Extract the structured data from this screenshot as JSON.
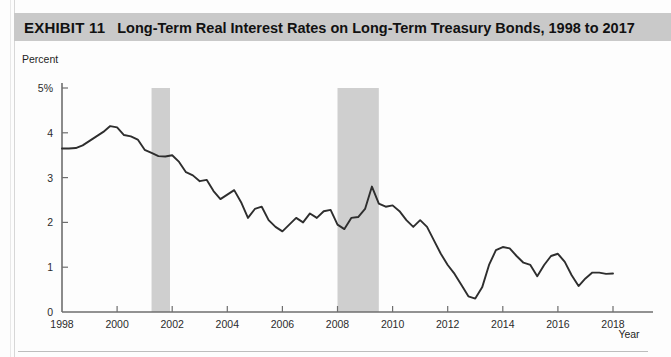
{
  "exhibit": {
    "label": "EXHIBIT 11",
    "title": "Long-Term Real Interest Rates on Long-Term Treasury Bonds, 1998 to 2017"
  },
  "axis": {
    "y_label": "Percent",
    "x_label": "Year"
  },
  "chart_data": {
    "type": "line",
    "title": "Long-Term Real Interest Rates on Long-Term Treasury Bonds, 1998 to 2017",
    "xlabel": "Year",
    "ylabel": "Percent",
    "xlim": [
      1998,
      2018
    ],
    "ylim": [
      0,
      5
    ],
    "xticks": [
      1998,
      2000,
      2002,
      2004,
      2006,
      2008,
      2010,
      2012,
      2014,
      2016,
      2018
    ],
    "xtick_labels": [
      "1998",
      "2000",
      "2002",
      "2004",
      "2006",
      "2008",
      "2010",
      "2012",
      "2014",
      "2016",
      "2018"
    ],
    "yticks": [
      0,
      1,
      2,
      3,
      4,
      5
    ],
    "ytick_labels": [
      "0",
      "1",
      "2",
      "3",
      "4",
      "5%"
    ],
    "grid": false,
    "legend": null,
    "line_color": "#2e2e2e",
    "shaded_regions": [
      {
        "name": "recession-2001",
        "x0": 2001.25,
        "x1": 2001.92,
        "color": "#cfcfcf"
      },
      {
        "name": "recession-2008",
        "x0": 2008.0,
        "x1": 2009.5,
        "color": "#cfcfcf"
      }
    ],
    "series": [
      {
        "name": "Long-term real interest rate",
        "x": [
          1998.0,
          1998.25,
          1998.5,
          1998.75,
          1999.0,
          1999.25,
          1999.5,
          1999.75,
          2000.0,
          2000.25,
          2000.5,
          2000.75,
          2001.0,
          2001.25,
          2001.5,
          2001.75,
          2002.0,
          2002.25,
          2002.5,
          2002.75,
          2003.0,
          2003.25,
          2003.5,
          2003.75,
          2004.0,
          2004.25,
          2004.5,
          2004.75,
          2005.0,
          2005.25,
          2005.5,
          2005.75,
          2006.0,
          2006.25,
          2006.5,
          2006.75,
          2007.0,
          2007.25,
          2007.5,
          2007.75,
          2008.0,
          2008.25,
          2008.5,
          2008.75,
          2009.0,
          2009.25,
          2009.5,
          2009.75,
          2010.0,
          2010.25,
          2010.5,
          2010.75,
          2011.0,
          2011.25,
          2011.5,
          2011.75,
          2012.0,
          2012.25,
          2012.5,
          2012.75,
          2013.0,
          2013.25,
          2013.5,
          2013.75,
          2014.0,
          2014.25,
          2014.5,
          2014.75,
          2015.0,
          2015.25,
          2015.5,
          2015.75,
          2016.0,
          2016.25,
          2016.5,
          2016.75,
          2017.0,
          2017.25,
          2017.5,
          2017.75,
          2018.0
        ],
        "y": [
          3.65,
          3.65,
          3.66,
          3.72,
          3.82,
          3.92,
          4.02,
          4.15,
          4.12,
          3.95,
          3.92,
          3.85,
          3.62,
          3.55,
          3.48,
          3.47,
          3.5,
          3.35,
          3.12,
          3.05,
          2.92,
          2.95,
          2.7,
          2.52,
          2.62,
          2.72,
          2.45,
          2.1,
          2.3,
          2.35,
          2.05,
          1.9,
          1.8,
          1.95,
          2.1,
          2.0,
          2.2,
          2.1,
          2.25,
          2.28,
          1.95,
          1.85,
          2.1,
          2.12,
          2.3,
          2.8,
          2.42,
          2.35,
          2.38,
          2.25,
          2.05,
          1.9,
          2.05,
          1.9,
          1.6,
          1.3,
          1.05,
          0.85,
          0.6,
          0.35,
          0.3,
          0.55,
          1.05,
          1.38,
          1.45,
          1.42,
          1.25,
          1.1,
          1.05,
          0.8,
          1.05,
          1.25,
          1.3,
          1.12,
          0.82,
          0.58,
          0.75,
          0.88,
          0.88,
          0.85,
          0.86
        ]
      }
    ]
  }
}
